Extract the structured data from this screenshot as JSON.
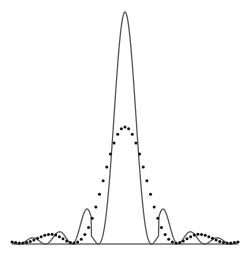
{
  "chart_data": {
    "type": "line",
    "title": "",
    "xlabel": "",
    "ylabel": "",
    "grid": false,
    "legend": null,
    "x_range": [
      -1,
      1
    ],
    "y_range": [
      0,
      1
    ],
    "series": [
      {
        "name": "solid-curve",
        "style": "solid",
        "color": "#555555",
        "description": "Narrow central peak with small side lobes (sinc^2-like)",
        "peak_value": 1.0,
        "first_zero_x": 0.235,
        "side_lobe_peaks": [
          {
            "x": -0.37,
            "y": 0.056
          },
          {
            "x": 0.37,
            "y": 0.056
          },
          {
            "x": -0.62,
            "y": 0.025
          },
          {
            "x": 0.62,
            "y": 0.025
          }
        ]
      },
      {
        "name": "dotted-curve",
        "style": "dotted",
        "color": "#111111",
        "description": "Broader, lower central peak with small side lobes",
        "peak_value": 0.5,
        "first_zero_x": 0.46,
        "side_lobe_peaks": [
          {
            "x": -0.68,
            "y": 0.03
          },
          {
            "x": 0.68,
            "y": 0.03
          }
        ]
      }
    ]
  }
}
